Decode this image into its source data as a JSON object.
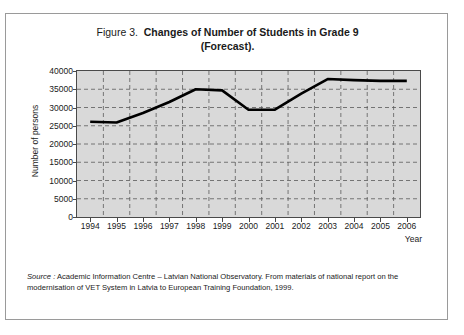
{
  "figure": {
    "title_prefix": "Figure 3.",
    "title_main": "Changes of Number of Students in Grade 9",
    "title_line2": "(Forecast)."
  },
  "source": {
    "label": "Source :",
    "text": " Academic Information Centre – Latvian National Observatory. From materials of national report on the modernisation of VET System in Latvia to European Training Foundation, 1999."
  },
  "chart_data": {
    "type": "line",
    "xlabel": "Year",
    "ylabel": "Number of persons",
    "x": [
      1994,
      1995,
      1996,
      1997,
      1998,
      1999,
      2000,
      2001,
      2002,
      2003,
      2004,
      2005,
      2006
    ],
    "categories": [
      "1994",
      "1995",
      "1996",
      "1997",
      "1998",
      "1999",
      "2000",
      "2001",
      "2002",
      "2003",
      "2004",
      "2005",
      "2006"
    ],
    "values": [
      26100,
      25900,
      28500,
      31500,
      35000,
      34700,
      29400,
      29400,
      33800,
      37800,
      37500,
      37300,
      37300
    ],
    "ylim": [
      0,
      40000
    ],
    "yticks": [
      0,
      5000,
      10000,
      15000,
      20000,
      25000,
      30000,
      35000,
      40000
    ],
    "ytick_labels": [
      "0",
      "5000",
      "10000",
      "15000",
      "20000",
      "25000",
      "30000",
      "35000",
      "40000"
    ],
    "grid": true,
    "grid_style": "dashed",
    "legend": false,
    "series": [
      {
        "name": "Number of persons in Grade 9",
        "color": "#000000",
        "values": [
          26100,
          25900,
          28500,
          31500,
          35000,
          34700,
          29400,
          29400,
          33800,
          37800,
          37500,
          37300,
          37300
        ]
      }
    ],
    "plot_background": "#d9d9d9",
    "line_color": "#000000"
  }
}
